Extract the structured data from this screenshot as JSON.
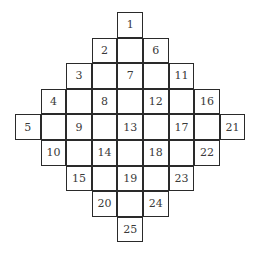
{
  "diagram": {
    "type": "diamond-number-grid",
    "grid_size": 9,
    "cells": [
      {
        "label": "1",
        "row": 0,
        "col": 4
      },
      {
        "label": "",
        "row": 1,
        "col": 4
      },
      {
        "label": "2",
        "row": 1,
        "col": 3
      },
      {
        "label": "6",
        "row": 1,
        "col": 5
      },
      {
        "label": "3",
        "row": 2,
        "col": 2
      },
      {
        "label": "",
        "row": 2,
        "col": 3
      },
      {
        "label": "7",
        "row": 2,
        "col": 4
      },
      {
        "label": "",
        "row": 2,
        "col": 5
      },
      {
        "label": "11",
        "row": 2,
        "col": 6
      },
      {
        "label": "4",
        "row": 3,
        "col": 1
      },
      {
        "label": "",
        "row": 3,
        "col": 2
      },
      {
        "label": "8",
        "row": 3,
        "col": 3
      },
      {
        "label": "",
        "row": 3,
        "col": 4
      },
      {
        "label": "12",
        "row": 3,
        "col": 5
      },
      {
        "label": "",
        "row": 3,
        "col": 6
      },
      {
        "label": "16",
        "row": 3,
        "col": 7
      },
      {
        "label": "5",
        "row": 4,
        "col": 0
      },
      {
        "label": "",
        "row": 4,
        "col": 1
      },
      {
        "label": "9",
        "row": 4,
        "col": 2
      },
      {
        "label": "",
        "row": 4,
        "col": 3
      },
      {
        "label": "13",
        "row": 4,
        "col": 4
      },
      {
        "label": "",
        "row": 4,
        "col": 5
      },
      {
        "label": "17",
        "row": 4,
        "col": 6
      },
      {
        "label": "",
        "row": 4,
        "col": 7
      },
      {
        "label": "21",
        "row": 4,
        "col": 8
      },
      {
        "label": "10",
        "row": 5,
        "col": 1
      },
      {
        "label": "",
        "row": 5,
        "col": 2
      },
      {
        "label": "14",
        "row": 5,
        "col": 3
      },
      {
        "label": "",
        "row": 5,
        "col": 4
      },
      {
        "label": "18",
        "row": 5,
        "col": 5
      },
      {
        "label": "",
        "row": 5,
        "col": 6
      },
      {
        "label": "22",
        "row": 5,
        "col": 7
      },
      {
        "label": "15",
        "row": 6,
        "col": 2
      },
      {
        "label": "",
        "row": 6,
        "col": 3
      },
      {
        "label": "19",
        "row": 6,
        "col": 4
      },
      {
        "label": "",
        "row": 6,
        "col": 5
      },
      {
        "label": "23",
        "row": 6,
        "col": 6
      },
      {
        "label": "20",
        "row": 7,
        "col": 3
      },
      {
        "label": "",
        "row": 7,
        "col": 4
      },
      {
        "label": "24",
        "row": 7,
        "col": 5
      },
      {
        "label": "25",
        "row": 8,
        "col": 4
      }
    ]
  }
}
